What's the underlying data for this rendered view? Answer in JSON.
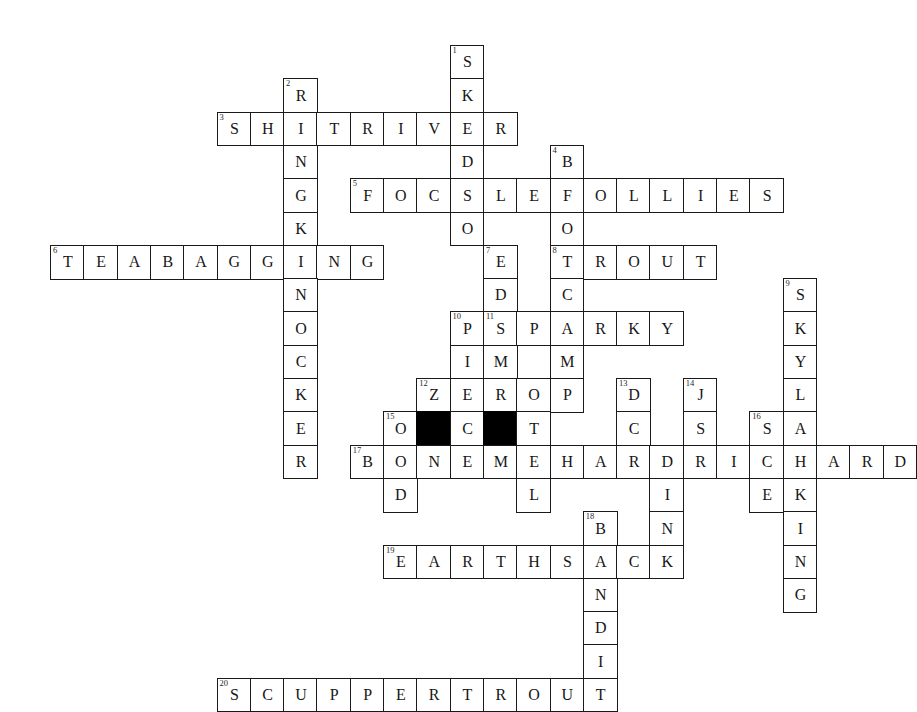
{
  "puzzle": {
    "title": "Crossword Grid",
    "grid": {
      "cell_size": 33.3,
      "origin_x": 50,
      "origin_y": 45,
      "columns": 26,
      "rows": 20,
      "border_color": "#1a1a1a",
      "block_color": "#000000",
      "cell_color": "#ffffff",
      "text_color": "#171717"
    },
    "entries": [
      {
        "number": "1",
        "direction": "down",
        "row": 0,
        "col": 12,
        "answer": "SKEDSO"
      },
      {
        "number": "2",
        "direction": "down",
        "row": 1,
        "col": 7,
        "answer": "RINGKNOCKER"
      },
      {
        "number": "3",
        "direction": "across",
        "row": 2,
        "col": 5,
        "answer": "SHITRIVER"
      },
      {
        "number": "4",
        "direction": "down",
        "row": 3,
        "col": 15,
        "answer": "BOOTCAMP"
      },
      {
        "number": "5",
        "direction": "across",
        "row": 4,
        "col": 9,
        "answer": "FOCSLEFOLLIES"
      },
      {
        "number": "6",
        "direction": "across",
        "row": 6,
        "col": 0,
        "answer": "TEABAGGING"
      },
      {
        "number": "7",
        "direction": "down",
        "row": 6,
        "col": 13,
        "answer": "EDSMOTEL"
      },
      {
        "number": "8",
        "direction": "across",
        "row": 6,
        "col": 15,
        "answer": "TROUT"
      },
      {
        "number": "9",
        "direction": "down",
        "row": 7,
        "col": 22,
        "answer": "SKYLARKING"
      },
      {
        "number": "10",
        "direction": "down",
        "row": 8,
        "col": 12,
        "answer": "PIEC"
      },
      {
        "number": "11",
        "direction": "across",
        "row": 8,
        "col": 13,
        "answer": "SPARKY"
      },
      {
        "number": "12",
        "direction": "across",
        "row": 10,
        "col": 11,
        "answer": "ZERO"
      },
      {
        "number": "13",
        "direction": "down",
        "row": 10,
        "col": 17,
        "answer": "DCDINK"
      },
      {
        "number": "14",
        "direction": "down",
        "row": 10,
        "col": 19,
        "answer": "JSI"
      },
      {
        "number": "15",
        "direction": "across",
        "row": 11,
        "col": 10,
        "answer": "O..C.T"
      },
      {
        "number": "16",
        "direction": "down",
        "row": 11,
        "col": 21,
        "answer": "SHE"
      },
      {
        "number": "17",
        "direction": "across",
        "row": 12,
        "col": 9,
        "answer": "BONEMEHARDRICHARD"
      },
      {
        "number": "18",
        "direction": "down",
        "row": 14,
        "col": 16,
        "answer": "BANDIT"
      },
      {
        "number": "19",
        "direction": "across",
        "row": 15,
        "col": 10,
        "answer": "EARTHSACK"
      },
      {
        "number": "20",
        "direction": "across",
        "row": 19,
        "col": 5,
        "answer": "SCUPPERTROUT"
      }
    ],
    "cells": [
      {
        "row": 0,
        "col": 12,
        "letter": "S",
        "number": "1"
      },
      {
        "row": 1,
        "col": 12,
        "letter": "K"
      },
      {
        "row": 1,
        "col": 7,
        "letter": "R",
        "number": "2"
      },
      {
        "row": 2,
        "col": 5,
        "letter": "S",
        "number": "3"
      },
      {
        "row": 2,
        "col": 6,
        "letter": "H"
      },
      {
        "row": 2,
        "col": 7,
        "letter": "I"
      },
      {
        "row": 2,
        "col": 8,
        "letter": "T"
      },
      {
        "row": 2,
        "col": 9,
        "letter": "R"
      },
      {
        "row": 2,
        "col": 10,
        "letter": "I"
      },
      {
        "row": 2,
        "col": 11,
        "letter": "V"
      },
      {
        "row": 2,
        "col": 12,
        "letter": "E"
      },
      {
        "row": 2,
        "col": 13,
        "letter": "R"
      },
      {
        "row": 3,
        "col": 7,
        "letter": "N"
      },
      {
        "row": 3,
        "col": 12,
        "letter": "D"
      },
      {
        "row": 3,
        "col": 15,
        "letter": "B",
        "number": "4"
      },
      {
        "row": 4,
        "col": 7,
        "letter": "G"
      },
      {
        "row": 4,
        "col": 9,
        "letter": "F",
        "number": "5"
      },
      {
        "row": 4,
        "col": 10,
        "letter": "O"
      },
      {
        "row": 4,
        "col": 11,
        "letter": "C"
      },
      {
        "row": 4,
        "col": 12,
        "letter": "S"
      },
      {
        "row": 4,
        "col": 13,
        "letter": "L"
      },
      {
        "row": 4,
        "col": 14,
        "letter": "E"
      },
      {
        "row": 4,
        "col": 15,
        "letter": "F"
      },
      {
        "row": 4,
        "col": 16,
        "letter": "O"
      },
      {
        "row": 4,
        "col": 17,
        "letter": "L"
      },
      {
        "row": 4,
        "col": 18,
        "letter": "L"
      },
      {
        "row": 4,
        "col": 19,
        "letter": "I"
      },
      {
        "row": 4,
        "col": 20,
        "letter": "E"
      },
      {
        "row": 4,
        "col": 21,
        "letter": "S"
      },
      {
        "row": 5,
        "col": 7,
        "letter": "K"
      },
      {
        "row": 5,
        "col": 12,
        "letter": "O"
      },
      {
        "row": 5,
        "col": 15,
        "letter": "O"
      },
      {
        "row": 6,
        "col": 0,
        "letter": "T",
        "number": "6"
      },
      {
        "row": 6,
        "col": 1,
        "letter": "E"
      },
      {
        "row": 6,
        "col": 2,
        "letter": "A"
      },
      {
        "row": 6,
        "col": 3,
        "letter": "B"
      },
      {
        "row": 6,
        "col": 4,
        "letter": "A"
      },
      {
        "row": 6,
        "col": 5,
        "letter": "G"
      },
      {
        "row": 6,
        "col": 6,
        "letter": "G"
      },
      {
        "row": 6,
        "col": 7,
        "letter": "I"
      },
      {
        "row": 6,
        "col": 8,
        "letter": "N"
      },
      {
        "row": 6,
        "col": 9,
        "letter": "G"
      },
      {
        "row": 6,
        "col": 13,
        "letter": "E",
        "number": "7"
      },
      {
        "row": 6,
        "col": 15,
        "letter": "T",
        "number": "8"
      },
      {
        "row": 6,
        "col": 16,
        "letter": "R"
      },
      {
        "row": 6,
        "col": 17,
        "letter": "O"
      },
      {
        "row": 6,
        "col": 18,
        "letter": "U"
      },
      {
        "row": 6,
        "col": 19,
        "letter": "T"
      },
      {
        "row": 7,
        "col": 7,
        "letter": "N"
      },
      {
        "row": 7,
        "col": 13,
        "letter": "D"
      },
      {
        "row": 7,
        "col": 15,
        "letter": "C"
      },
      {
        "row": 7,
        "col": 22,
        "letter": "S",
        "number": "9"
      },
      {
        "row": 8,
        "col": 7,
        "letter": "O"
      },
      {
        "row": 8,
        "col": 12,
        "letter": "P",
        "number": "10"
      },
      {
        "row": 8,
        "col": 13,
        "letter": "S",
        "number": "11"
      },
      {
        "row": 8,
        "col": 14,
        "letter": "P"
      },
      {
        "row": 8,
        "col": 15,
        "letter": "A"
      },
      {
        "row": 8,
        "col": 16,
        "letter": "R"
      },
      {
        "row": 8,
        "col": 17,
        "letter": "K"
      },
      {
        "row": 8,
        "col": 18,
        "letter": "Y"
      },
      {
        "row": 8,
        "col": 22,
        "letter": "K"
      },
      {
        "row": 9,
        "col": 7,
        "letter": "C"
      },
      {
        "row": 9,
        "col": 12,
        "letter": "I"
      },
      {
        "row": 9,
        "col": 13,
        "letter": "M"
      },
      {
        "row": 9,
        "col": 15,
        "letter": "M"
      },
      {
        "row": 9,
        "col": 22,
        "letter": "Y"
      },
      {
        "row": 10,
        "col": 7,
        "letter": "K"
      },
      {
        "row": 10,
        "col": 11,
        "letter": "Z",
        "number": "12"
      },
      {
        "row": 10,
        "col": 12,
        "letter": "E"
      },
      {
        "row": 10,
        "col": 13,
        "letter": "R"
      },
      {
        "row": 10,
        "col": 14,
        "letter": "O"
      },
      {
        "row": 10,
        "col": 15,
        "letter": "P"
      },
      {
        "row": 10,
        "col": 17,
        "letter": "D",
        "number": "13"
      },
      {
        "row": 10,
        "col": 19,
        "letter": "J",
        "number": "14"
      },
      {
        "row": 10,
        "col": 22,
        "letter": "L"
      },
      {
        "row": 11,
        "col": 7,
        "letter": "E"
      },
      {
        "row": 11,
        "col": 10,
        "letter": "O",
        "number": "15"
      },
      {
        "row": 11,
        "col": 11,
        "letter": "",
        "black": true
      },
      {
        "row": 11,
        "col": 12,
        "letter": "C"
      },
      {
        "row": 11,
        "col": 13,
        "letter": "",
        "black": true
      },
      {
        "row": 11,
        "col": 14,
        "letter": "T"
      },
      {
        "row": 11,
        "col": 17,
        "letter": "C"
      },
      {
        "row": 11,
        "col": 19,
        "letter": "S"
      },
      {
        "row": 11,
        "col": 21,
        "letter": "S",
        "number": "16"
      },
      {
        "row": 11,
        "col": 22,
        "letter": "A"
      },
      {
        "row": 12,
        "col": 7,
        "letter": "R"
      },
      {
        "row": 12,
        "col": 9,
        "letter": "B",
        "number": "17"
      },
      {
        "row": 12,
        "col": 10,
        "letter": "O"
      },
      {
        "row": 12,
        "col": 11,
        "letter": "N"
      },
      {
        "row": 12,
        "col": 12,
        "letter": "E"
      },
      {
        "row": 12,
        "col": 13,
        "letter": "M"
      },
      {
        "row": 12,
        "col": 14,
        "letter": "E"
      },
      {
        "row": 12,
        "col": 15,
        "letter": "H"
      },
      {
        "row": 12,
        "col": 16,
        "letter": "A"
      },
      {
        "row": 12,
        "col": 17,
        "letter": "R"
      },
      {
        "row": 12,
        "col": 18,
        "letter": "D"
      },
      {
        "row": 12,
        "col": 19,
        "letter": "R"
      },
      {
        "row": 12,
        "col": 20,
        "letter": "I"
      },
      {
        "row": 12,
        "col": 21,
        "letter": "C"
      },
      {
        "row": 12,
        "col": 22,
        "letter": "H"
      },
      {
        "row": 12,
        "col": 23,
        "letter": "A"
      },
      {
        "row": 12,
        "col": 24,
        "letter": "R"
      },
      {
        "row": 12,
        "col": 25,
        "letter": "D"
      },
      {
        "row": 13,
        "col": 10,
        "letter": "D"
      },
      {
        "row": 13,
        "col": 14,
        "letter": "L"
      },
      {
        "row": 13,
        "col": 18,
        "letter": "I"
      },
      {
        "row": 13,
        "col": 21,
        "letter": "E"
      },
      {
        "row": 13,
        "col": 22,
        "letter": "K"
      },
      {
        "row": 14,
        "col": 16,
        "letter": "B",
        "number": "18"
      },
      {
        "row": 14,
        "col": 18,
        "letter": "N"
      },
      {
        "row": 14,
        "col": 22,
        "letter": "I"
      },
      {
        "row": 15,
        "col": 10,
        "letter": "E",
        "number": "19"
      },
      {
        "row": 15,
        "col": 11,
        "letter": "A"
      },
      {
        "row": 15,
        "col": 12,
        "letter": "R"
      },
      {
        "row": 15,
        "col": 13,
        "letter": "T"
      },
      {
        "row": 15,
        "col": 14,
        "letter": "H"
      },
      {
        "row": 15,
        "col": 15,
        "letter": "S"
      },
      {
        "row": 15,
        "col": 16,
        "letter": "A"
      },
      {
        "row": 15,
        "col": 17,
        "letter": "C"
      },
      {
        "row": 15,
        "col": 18,
        "letter": "K"
      },
      {
        "row": 15,
        "col": 22,
        "letter": "N"
      },
      {
        "row": 16,
        "col": 16,
        "letter": "N"
      },
      {
        "row": 16,
        "col": 22,
        "letter": "G"
      },
      {
        "row": 17,
        "col": 16,
        "letter": "D"
      },
      {
        "row": 18,
        "col": 16,
        "letter": "I"
      },
      {
        "row": 19,
        "col": 5,
        "letter": "S",
        "number": "20"
      },
      {
        "row": 19,
        "col": 6,
        "letter": "C"
      },
      {
        "row": 19,
        "col": 7,
        "letter": "U"
      },
      {
        "row": 19,
        "col": 8,
        "letter": "P"
      },
      {
        "row": 19,
        "col": 9,
        "letter": "P"
      },
      {
        "row": 19,
        "col": 10,
        "letter": "E"
      },
      {
        "row": 19,
        "col": 11,
        "letter": "R"
      },
      {
        "row": 19,
        "col": 12,
        "letter": "T"
      },
      {
        "row": 19,
        "col": 13,
        "letter": "R"
      },
      {
        "row": 19,
        "col": 14,
        "letter": "O"
      },
      {
        "row": 19,
        "col": 15,
        "letter": "U"
      },
      {
        "row": 19,
        "col": 16,
        "letter": "T"
      }
    ]
  }
}
